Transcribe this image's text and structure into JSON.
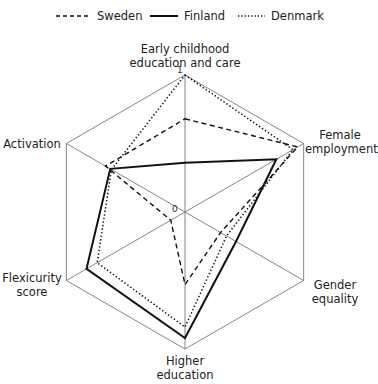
{
  "chart_data": {
    "type": "radar",
    "title": "",
    "axes": [
      "Early childhood education and care",
      "Female employment",
      "Gender equality",
      "Higher education",
      "Flexicurity score",
      "Activation"
    ],
    "range": [
      0,
      1
    ],
    "tick_labels": {
      "min": "0",
      "max": "1"
    },
    "series": [
      {
        "name": "Sweden",
        "style": "dashed",
        "values": [
          0.68,
          0.95,
          0.3,
          0.53,
          0.12,
          0.67
        ]
      },
      {
        "name": "Finland",
        "style": "solid",
        "values": [
          0.36,
          0.77,
          0.43,
          0.92,
          0.83,
          0.63
        ]
      },
      {
        "name": "Denmark",
        "style": "dotted",
        "values": [
          1.0,
          0.91,
          0.35,
          0.84,
          0.74,
          0.62
        ]
      }
    ],
    "legend_position": "top",
    "grid": "outer hexagon with spokes"
  },
  "legend": {
    "sweden": "Sweden",
    "finland": "Finland",
    "denmark": "Denmark"
  },
  "labels": {
    "ecec_line1": "Early childhood",
    "ecec_line2": "education and care",
    "female_line1": "Female",
    "female_line2": "employment",
    "gender_line1": "Gender",
    "gender_line2": "equality",
    "higher_line1": "Higher",
    "higher_line2": "education",
    "flex_line1": "Flexicurity",
    "flex_line2": "score",
    "activation": "Activation"
  },
  "ticks": {
    "zero": "0",
    "one": "1"
  },
  "colors": {
    "series": "#111111",
    "grid": "#777777"
  }
}
